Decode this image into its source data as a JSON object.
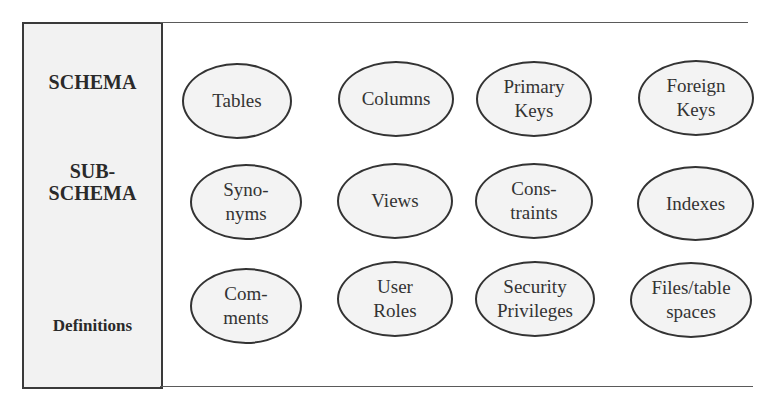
{
  "diagram": {
    "row_labels": [
      {
        "label": "SCHEMA"
      },
      {
        "label": "SUB-\nSCHEMA"
      },
      {
        "label": "Definitions"
      }
    ],
    "rows": [
      {
        "items": [
          {
            "label": "Tables"
          },
          {
            "label": "Columns"
          },
          {
            "label": "Primary\nKeys"
          },
          {
            "label": "Foreign\nKeys"
          }
        ]
      },
      {
        "items": [
          {
            "label": "Syno-\nnyms"
          },
          {
            "label": "Views"
          },
          {
            "label": "Cons-\ntraints"
          },
          {
            "label": "Indexes"
          }
        ]
      },
      {
        "items": [
          {
            "label": "Com-\nments"
          },
          {
            "label": "User\nRoles"
          },
          {
            "label": "Security\nPrivileges"
          },
          {
            "label": "Files/table\nspaces"
          }
        ]
      }
    ],
    "colors": {
      "panel_fill": "#f2f2f2",
      "ellipse_fill": "#f3f3f3",
      "stroke": "#333333"
    }
  }
}
